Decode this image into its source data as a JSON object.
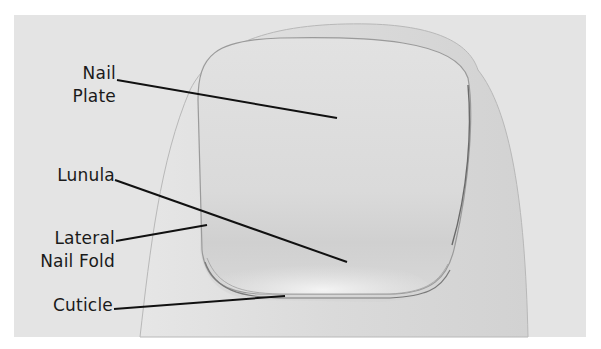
{
  "diagram": {
    "colors": {
      "background": "#e4e4e4",
      "skin": "#dcdcdc",
      "nail": "#e0e0e0",
      "lunula": "#f0f0f0",
      "outline": "#8a8a8a",
      "leader_line": "#111111",
      "label_text": "#1a1a1a"
    },
    "labels": [
      {
        "id": "nail-plate",
        "lines": [
          "Nail",
          "Plate"
        ],
        "target": "center of nail plate"
      },
      {
        "id": "lunula",
        "lines": [
          "Lunula"
        ],
        "target": "pale crescent at nail base"
      },
      {
        "id": "lateral-nail-fold",
        "lines": [
          "Lateral",
          "Nail Fold"
        ],
        "target": "skin fold at left nail edge"
      },
      {
        "id": "cuticle",
        "lines": [
          "Cuticle"
        ],
        "target": "thin skin edge at nail base"
      }
    ],
    "leader_lines": [
      {
        "label": "nail-plate",
        "from": [
          117,
          80
        ],
        "to": [
          337,
          118
        ]
      },
      {
        "label": "lunula",
        "from": [
          115,
          180
        ],
        "to": [
          347,
          262
        ]
      },
      {
        "label": "lateral-nail-fold",
        "from": [
          116,
          241
        ],
        "to": [
          207,
          225
        ]
      },
      {
        "label": "cuticle",
        "from": [
          114,
          309
        ],
        "to": [
          285,
          296
        ]
      }
    ]
  }
}
